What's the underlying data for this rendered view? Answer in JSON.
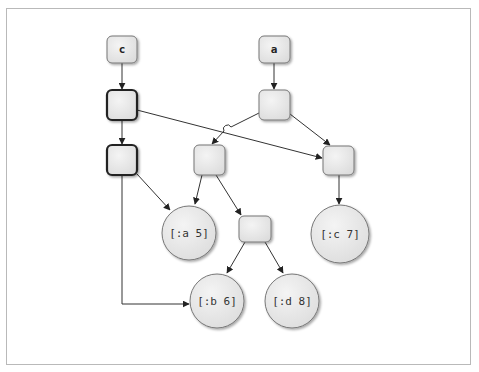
{
  "diagram": {
    "type": "persistent-data-structure-tree",
    "roots": [
      {
        "id": "c",
        "label": "c"
      },
      {
        "id": "a",
        "label": "a"
      }
    ],
    "leaves": [
      {
        "id": "leaf-a5",
        "label": "[:a 5]"
      },
      {
        "id": "leaf-c7",
        "label": "[:c 7]"
      },
      {
        "id": "leaf-b6",
        "label": "[:b 6]"
      },
      {
        "id": "leaf-d8",
        "label": "[:d 8]"
      }
    ],
    "edges": [
      [
        "c",
        "c-node-1"
      ],
      [
        "c-node-1",
        "c-node-2"
      ],
      [
        "c-node-1",
        "a-right"
      ],
      [
        "c-node-2",
        "leaf-a5"
      ],
      [
        "c-node-2",
        "leaf-b6"
      ],
      [
        "a",
        "a-node-1"
      ],
      [
        "a-node-1",
        "a-left"
      ],
      [
        "a-node-1",
        "a-right"
      ],
      [
        "a-left",
        "leaf-a5"
      ],
      [
        "a-left",
        "a-bd"
      ],
      [
        "a-right",
        "leaf-c7"
      ],
      [
        "a-bd",
        "leaf-b6"
      ],
      [
        "a-bd",
        "leaf-d8"
      ]
    ],
    "colors": {
      "node_fill": "#e8e8e8",
      "node_stroke": "#777777",
      "bold_stroke": "#222222",
      "edge": "#333333",
      "frame": "#b9b9b9"
    }
  }
}
